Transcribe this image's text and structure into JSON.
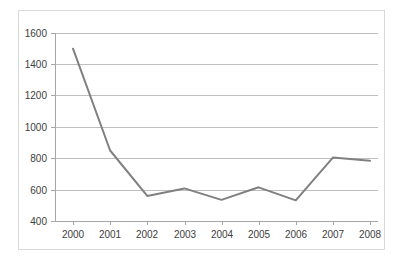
{
  "chart_data": {
    "type": "line",
    "title": "",
    "subtitle": "",
    "xlabel": "",
    "ylabel": "",
    "categories": [
      "2000",
      "2001",
      "2002",
      "2003",
      "2004",
      "2005",
      "2006",
      "2007",
      "2008"
    ],
    "x": [
      2000,
      2001,
      2002,
      2003,
      2004,
      2005,
      2006,
      2007,
      2008
    ],
    "series": [
      {
        "name": "",
        "color": "#808080",
        "values": [
          1500,
          850,
          560,
          608,
          535,
          615,
          532,
          805,
          785
        ]
      }
    ],
    "values": [
      1500,
      850,
      560,
      608,
      535,
      615,
      532,
      805,
      785
    ],
    "ylim": [
      400,
      1600
    ],
    "ytick_step": 200,
    "yticks": [
      400,
      600,
      800,
      1000,
      1200,
      1400,
      1600
    ],
    "ytick_labels": [
      "400",
      "600",
      "800",
      "1000",
      "1200",
      "1400",
      "1600"
    ],
    "xtick_labels": [
      "2000",
      "2001",
      "2002",
      "2003",
      "2004",
      "2005",
      "2006",
      "2007",
      "2008"
    ],
    "grid": true,
    "grid_axis": "y",
    "legend": false,
    "legend_position": "none",
    "markers": false,
    "annotations": [],
    "colors": {
      "line": "#808080",
      "grid": "#bfbfbf",
      "axis": "#a6a6a6",
      "text": "#404040",
      "frame": "#d9d9d9",
      "background": "#ffffff"
    }
  },
  "figure": {
    "frame_label": "chart-frame",
    "plot_label": "plot-area"
  }
}
